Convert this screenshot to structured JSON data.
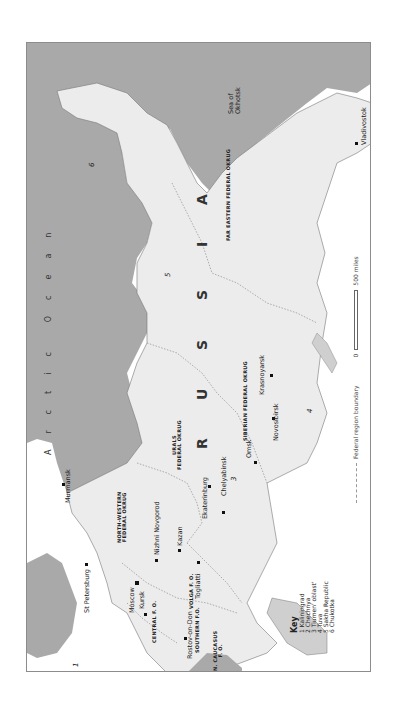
{
  "map": {
    "title": "Russia Federal Okrugs",
    "orientation": "rotated 90 degrees counter-clockwise",
    "colors": {
      "ocean": "#a9a9a9",
      "land": "#ececec",
      "foreign": "#ffffff",
      "frame": "#8c8c8c",
      "boundary": "#999999"
    },
    "country_letters": [
      "R",
      "U",
      "S",
      "S",
      "I",
      "A"
    ],
    "water_bodies": {
      "arctic": [
        "A",
        "r",
        "c",
        "t",
        "i",
        "c",
        "O",
        "c",
        "e",
        "a",
        "n"
      ],
      "okhotsk_line1": "Sea of",
      "okhotsk_line2": "Okhotsk"
    },
    "okrugs": {
      "northwestern_1": "NORTH-WESTERN",
      "northwestern_2": "FEDERAL OKRUG",
      "central": "CENTRAL F. O.",
      "southern": "SOUTHERN F.O.",
      "ncaucasus_1": "N. CAUCASUS",
      "ncaucasus_2": "F. O.",
      "volga": "VOLGA F. O.",
      "urals_1": "URALS",
      "urals_2": "FEDERAL OKRUG",
      "siberian": "SIBERIAN FEDERAL OKRUG",
      "fareastern": "FAR EASTERN FEDERAL OKRUG"
    },
    "cities": {
      "murmansk": "Murmansk",
      "stpetersburg": "St Petersburg",
      "moscow": "Moscow",
      "kursk": "Kursk",
      "nizhni": "Nizhni Novgorod",
      "kazan": "Kazan",
      "togliatti": "Togliatti",
      "rostov": "Rostov-on-Don",
      "ekaterinburg": "Ekaterinburg",
      "chelyabinsk": "Chelyabinsk",
      "omsk": "Omsk",
      "novosibirsk": "Novosibirsk",
      "krasnoyarsk": "Krasnoyarsk",
      "vladivostok": "Vladivostok"
    },
    "region_numbers": {
      "n1": "1",
      "n2": "2",
      "n3": "3",
      "n4": "4",
      "n5": "5",
      "n6": "6"
    },
    "key": {
      "title": "Key",
      "items": [
        "1 Kaliningrad",
        "2 Chechnya",
        "3 Tiumen' oblast'",
        "4 Tuva",
        "5 Sakha Republic",
        "6 Chukotka"
      ]
    },
    "legend": {
      "boundary_label": "Federal region boundary",
      "scale_start": "0",
      "scale_end": "500 miles"
    }
  }
}
